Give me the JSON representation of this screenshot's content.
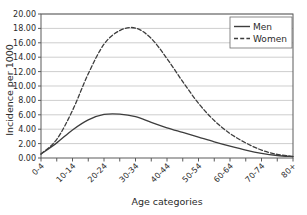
{
  "chart_data": {
    "type": "line",
    "title": "",
    "xlabel": "Age categories",
    "ylabel": "Incidence per 1000",
    "ylim": [
      0,
      20
    ],
    "ytick_labels": [
      "0.00",
      "2.00",
      "4.00",
      "6.00",
      "8.00",
      "10.00",
      "12.00",
      "14.00",
      "16.00",
      "18.00",
      "20.00"
    ],
    "ytick_values": [
      0,
      2,
      4,
      6,
      8,
      10,
      12,
      14,
      16,
      18,
      20
    ],
    "grid": "horizontal",
    "legend_position": "top-right",
    "categories": [
      "0-4",
      "5-9",
      "10-14",
      "15-19",
      "20-24",
      "25-29",
      "30-34",
      "35-39",
      "40-44",
      "45-49",
      "50-54",
      "55-59",
      "60-64",
      "65-69",
      "70-74",
      "75-79",
      "80+"
    ],
    "xtick_labels": [
      "0-4",
      "10-14",
      "20-24",
      "30-34",
      "40-44",
      "50-54",
      "60-64",
      "70-74",
      "80+"
    ],
    "xtick_label_indices": [
      0,
      2,
      4,
      6,
      8,
      10,
      12,
      14,
      16
    ],
    "series": [
      {
        "name": "Men",
        "style": "solid",
        "color": "#3d3d3d",
        "values": [
          0.55,
          2.1,
          3.9,
          5.3,
          6.05,
          6.1,
          5.75,
          4.95,
          4.2,
          3.55,
          2.9,
          2.25,
          1.65,
          1.1,
          0.65,
          0.35,
          0.2
        ]
      },
      {
        "name": "Women",
        "style": "dashed",
        "color": "#3d3d3d",
        "values": [
          0.55,
          2.6,
          6.6,
          11.7,
          15.8,
          17.7,
          18.05,
          16.6,
          13.8,
          10.6,
          7.6,
          5.2,
          3.4,
          2.1,
          1.1,
          0.5,
          0.22
        ]
      }
    ]
  },
  "legend": {
    "items": [
      {
        "label": "Men",
        "style": "solid"
      },
      {
        "label": "Women",
        "style": "dashed"
      }
    ]
  },
  "colors": {
    "line": "#3d3d3d",
    "grid": "#b9b9b9",
    "axis": "#5a5a5a",
    "text": "#2b2b2b",
    "background": "#ffffff"
  }
}
